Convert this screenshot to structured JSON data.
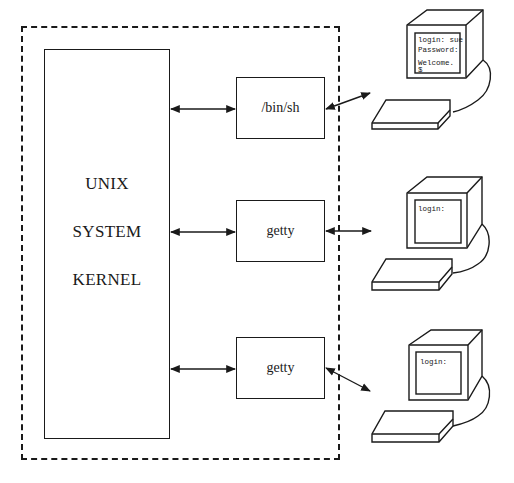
{
  "diagram": {
    "kernel": {
      "lines": [
        "UNIX",
        "SYSTEM",
        "KERNEL"
      ]
    },
    "processes": [
      {
        "label": "/bin/sh"
      },
      {
        "label": "getty"
      },
      {
        "label": "getty"
      }
    ],
    "terminals": [
      {
        "screen_lines": [
          "login: sue",
          "Password:",
          "",
          "Welcome.",
          "$"
        ]
      },
      {
        "screen_lines": [
          "login:"
        ]
      },
      {
        "screen_lines": [
          "login:"
        ]
      }
    ],
    "colors": {
      "stroke": "#1a1a1a",
      "background": "#ffffff"
    }
  }
}
